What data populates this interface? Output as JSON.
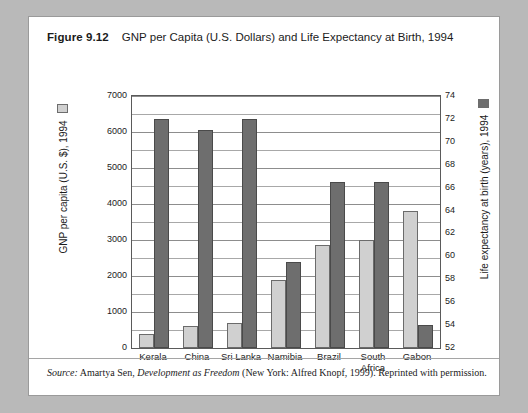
{
  "figure": {
    "number_label": "Figure 9.12",
    "title": "GNP per Capita (U.S. Dollars) and Life Expectancy at Birth, 1994",
    "source_prefix": "Source:",
    "source_author": " Amartya Sen, ",
    "source_work": "Development as Freedom",
    "source_rest": " (New York: Alfred Knopf, 1999). Reprinted with permission."
  },
  "legend": {
    "gnp_label": "GNP per capita (U.S. $), 1994",
    "gnp_color": "#d0d0d0",
    "life_label": "Life expectancy at birth (years), 1994",
    "life_color": "#6e6e6e"
  },
  "chart_data": {
    "type": "bar",
    "title": "GNP per Capita (U.S. Dollars) and Life Expectancy at Birth, 1994",
    "xlabel": "",
    "categories": [
      "Kerala",
      "China",
      "Sri Lanka",
      "Namibia",
      "Brazil",
      "South\nAfrica",
      "Gabon"
    ],
    "category_labels": [
      "Kerala",
      "China",
      "Sri Lanka",
      "Namibia",
      "Brazil",
      "South Africa",
      "Gabon"
    ],
    "series": [
      {
        "name": "GNP per capita (U.S. $), 1994",
        "axis": "left",
        "color": "#d0d0d0",
        "values": [
          400,
          600,
          700,
          1900,
          2850,
          3000,
          3800
        ]
      },
      {
        "name": "Life expectancy at birth (years), 1994",
        "axis": "right",
        "color": "#6e6e6e",
        "values": [
          72,
          71,
          72,
          59.5,
          66.5,
          66.5,
          54
        ]
      }
    ],
    "left_axis": {
      "label": "GNP per capita (U.S. $), 1994",
      "ticks": [
        0,
        1000,
        2000,
        3000,
        4000,
        5000,
        6000,
        7000
      ],
      "tick_labels": [
        "0",
        "1000",
        "2000",
        "3000",
        "4000",
        "5000",
        "6000",
        "7000"
      ],
      "ylim": [
        0,
        7000
      ],
      "minor_step": 500
    },
    "right_axis": {
      "label": "Life expectancy at birth (years), 1994",
      "ticks": [
        52,
        54,
        56,
        58,
        60,
        62,
        64,
        66,
        68,
        70,
        72,
        74
      ],
      "tick_labels": [
        "52",
        "54",
        "56",
        "58",
        "60",
        "62",
        "64",
        "66",
        "68",
        "70",
        "72",
        "74"
      ],
      "ylim": [
        52,
        74
      ]
    },
    "grid": true,
    "legend_position": "axis-titles"
  }
}
